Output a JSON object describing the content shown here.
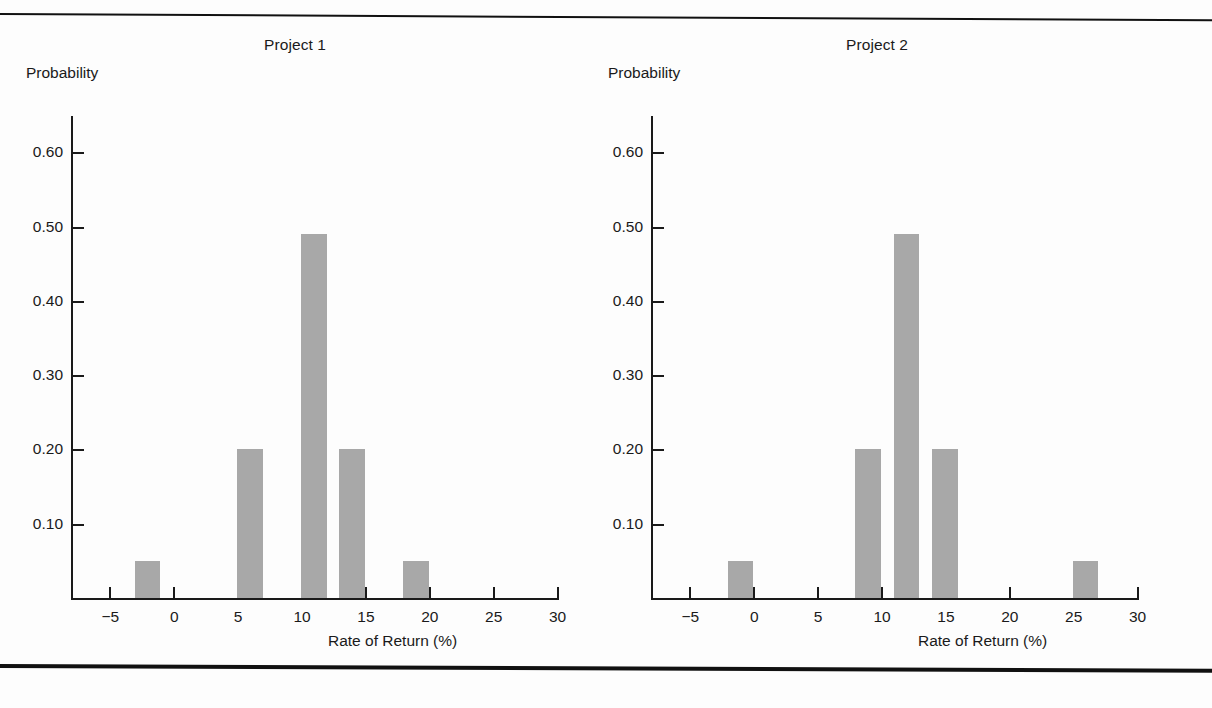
{
  "figure": {
    "background_color": "#fdfdfd",
    "bar_color": "#a8a8a8",
    "axis_color": "#1a1a1a",
    "rule_top": "horizontal-rule",
    "rule_bottom": "horizontal-rule"
  },
  "chart_data": [
    {
      "type": "bar",
      "title": "Project 1",
      "xlabel": "Rate of Return (%)",
      "ylabel": "Probability",
      "xlim": [
        -8,
        30
      ],
      "ylim": [
        0,
        0.66
      ],
      "grid": false,
      "legend": "none",
      "xticks": [
        -5,
        0,
        5,
        10,
        15,
        20,
        25,
        30
      ],
      "xtick_labels": [
        "−5",
        "0",
        "5",
        "10",
        "15",
        "20",
        "25",
        "30"
      ],
      "yticks": [
        0.1,
        0.2,
        0.3,
        0.4,
        0.5,
        0.6
      ],
      "ytick_labels": [
        "0.10",
        "0.20",
        "0.30",
        "0.40",
        "0.50",
        "0.60"
      ],
      "bars": [
        {
          "x_start": -3,
          "x_end": -1,
          "value": 0.05
        },
        {
          "x_start": 5,
          "x_end": 7,
          "value": 0.2
        },
        {
          "x_start": 10,
          "x_end": 12,
          "value": 0.49
        },
        {
          "x_start": 13,
          "x_end": 15,
          "value": 0.2
        },
        {
          "x_start": 18,
          "x_end": 20,
          "value": 0.05
        }
      ]
    },
    {
      "type": "bar",
      "title": "Project 2",
      "xlabel": "Rate of Return (%)",
      "ylabel": "Probability",
      "xlim": [
        -8,
        30
      ],
      "ylim": [
        0,
        0.66
      ],
      "grid": false,
      "legend": "none",
      "xticks": [
        -5,
        0,
        5,
        10,
        15,
        20,
        25,
        30
      ],
      "xtick_labels": [
        "−5",
        "0",
        "5",
        "10",
        "15",
        "20",
        "25",
        "30"
      ],
      "yticks": [
        0.1,
        0.2,
        0.3,
        0.4,
        0.5,
        0.6
      ],
      "ytick_labels": [
        "0.10",
        "0.20",
        "0.30",
        "0.40",
        "0.50",
        "0.60"
      ],
      "bars": [
        {
          "x_start": -2,
          "x_end": 0,
          "value": 0.05
        },
        {
          "x_start": 8,
          "x_end": 10,
          "value": 0.2
        },
        {
          "x_start": 11,
          "x_end": 13,
          "value": 0.49
        },
        {
          "x_start": 14,
          "x_end": 16,
          "value": 0.2
        },
        {
          "x_start": 25,
          "x_end": 27,
          "value": 0.05
        }
      ]
    }
  ]
}
